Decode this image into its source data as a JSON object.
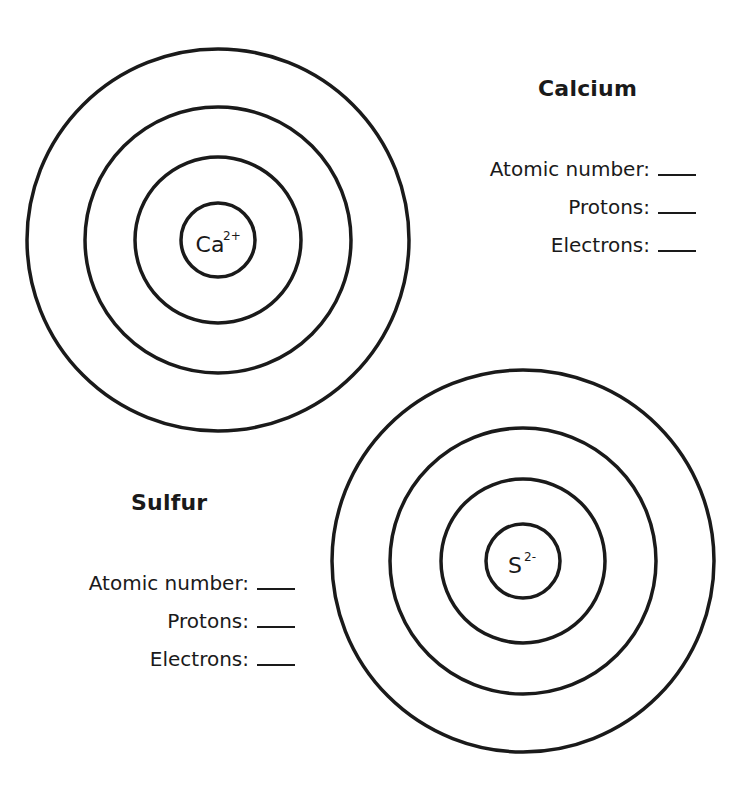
{
  "atoms": [
    {
      "name": "Calcium",
      "symbol": "Ca",
      "charge": "2+",
      "center": [
        218,
        240
      ],
      "ring_radii": [
        191,
        133,
        83
      ],
      "nucleus_radius": 37,
      "fields": [
        {
          "label": "Atomic number:",
          "value": ""
        },
        {
          "label": "Protons:",
          "value": ""
        },
        {
          "label": "Electrons:",
          "value": ""
        }
      ]
    },
    {
      "name": "Sulfur",
      "symbol": "S",
      "charge": "2-",
      "center": [
        523,
        561
      ],
      "ring_radii": [
        191,
        133,
        82
      ],
      "nucleus_radius": 37,
      "fields": [
        {
          "label": "Atomic number:",
          "value": ""
        },
        {
          "label": "Protons:",
          "value": ""
        },
        {
          "label": "Electrons:",
          "value": ""
        }
      ]
    }
  ],
  "colors": {
    "line": "#1a1a1a",
    "background": "#ffffff"
  }
}
